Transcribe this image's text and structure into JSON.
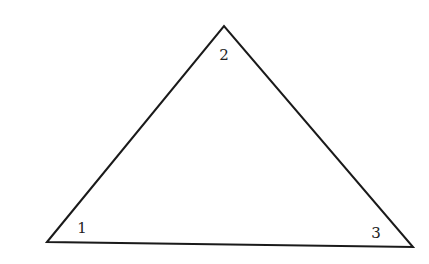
{
  "diagram": {
    "type": "triangle",
    "stroke_color": "#1a1a1a",
    "vertices": [
      {
        "id": "1",
        "x": 47,
        "y": 242
      },
      {
        "id": "2",
        "x": 224,
        "y": 26
      },
      {
        "id": "3",
        "x": 413,
        "y": 247
      }
    ],
    "angle_labels": [
      {
        "text": "1",
        "x": 82,
        "y": 233
      },
      {
        "text": "2",
        "x": 224,
        "y": 60
      },
      {
        "text": "3",
        "x": 376,
        "y": 238
      }
    ]
  }
}
